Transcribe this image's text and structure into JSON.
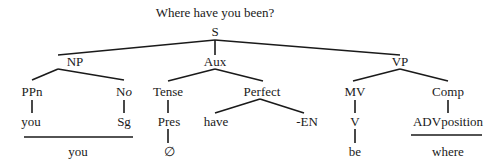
{
  "title": "Where have you been?",
  "tree": {
    "root": "S",
    "level1": [
      "NP",
      "Aux",
      "VP"
    ],
    "level2": {
      "np_ppn": "PPn",
      "np_no": "No",
      "aux_tense": "Tense",
      "aux_perfect": "Perfect",
      "vp_mv": "MV",
      "vp_comp": "Comp"
    },
    "level3": {
      "ppn_you": "you",
      "no_sg": "Sg",
      "tense_pres": "Pres",
      "perfect_have": "have",
      "perfect_en": "-EN",
      "mv_v": "V",
      "comp_adv": "ADVposition"
    },
    "level4": {
      "np_surface": "you",
      "pres_null": "∅",
      "v_be": "be",
      "adv_where": "where"
    }
  }
}
